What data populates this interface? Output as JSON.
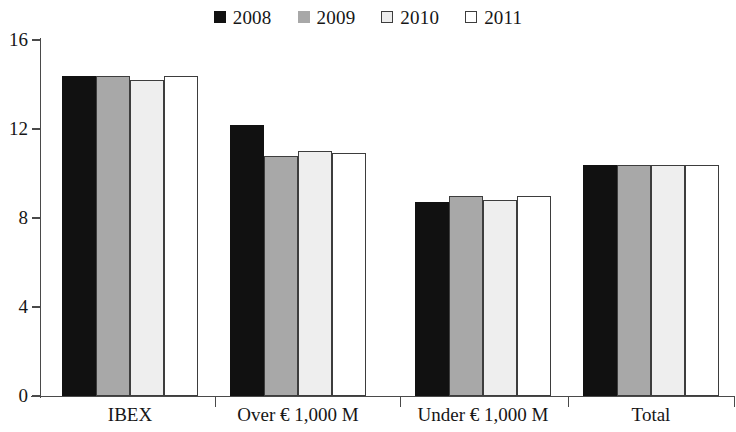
{
  "chart_data": {
    "type": "bar",
    "title": "",
    "xlabel": "",
    "ylabel": "",
    "ylim": [
      0,
      16
    ],
    "yticks": [
      0,
      4,
      8,
      12,
      16
    ],
    "grid": false,
    "legend_position": "top-center",
    "categories": [
      "IBEX",
      "Over € 1,000 M",
      "Under € 1,000 M",
      "Total"
    ],
    "series": [
      {
        "name": "2008",
        "color": "#111111",
        "values": [
          14.4,
          12.2,
          8.7,
          10.4
        ]
      },
      {
        "name": "2009",
        "color": "#a8a8a8",
        "values": [
          14.4,
          10.8,
          9.0,
          10.4
        ]
      },
      {
        "name": "2010",
        "color": "#eeeeee",
        "values": [
          14.2,
          11.0,
          8.8,
          10.4
        ]
      },
      {
        "name": "2011",
        "color": "#ffffff",
        "values": [
          14.4,
          10.9,
          9.0,
          10.4
        ]
      }
    ]
  },
  "legend": {
    "entries": [
      {
        "label": "2008",
        "swatch": "filled-black-square-icon"
      },
      {
        "label": "2009",
        "swatch": "filled-gray-square-icon"
      },
      {
        "label": "2010",
        "swatch": "outlined-light-square-icon"
      },
      {
        "label": "2011",
        "swatch": "outlined-white-square-icon"
      }
    ]
  },
  "axes": {
    "y_tick_labels": [
      "16",
      "12",
      "8",
      "4",
      "0"
    ],
    "x_tick_labels": [
      "IBEX",
      "Over € 1,000 M",
      "Under € 1,000 M",
      "Total"
    ]
  }
}
